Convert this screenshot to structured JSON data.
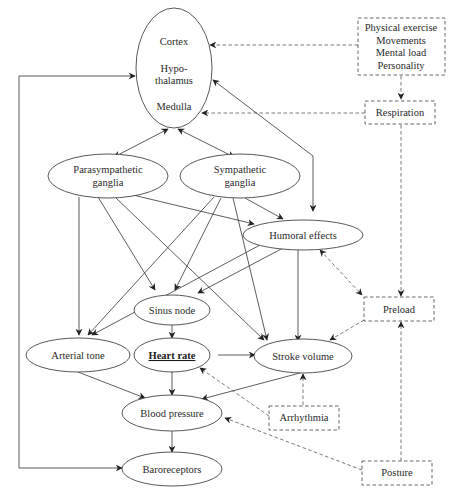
{
  "diagram": {
    "nodes": {
      "brain": {
        "lines": [
          "Cortex",
          "Hypo-",
          "thalamus",
          "Medulla"
        ]
      },
      "parasympathetic": {
        "lines": [
          "Parasympathetic",
          "ganglia"
        ]
      },
      "sympathetic": {
        "lines": [
          "Sympathetic",
          "ganglia"
        ]
      },
      "humoral": {
        "label": "Humoral effects"
      },
      "sinus": {
        "label": "Sinus node"
      },
      "arterial": {
        "label": "Arterial tone"
      },
      "heart_rate": {
        "label": "Heart rate"
      },
      "stroke_volume": {
        "label": "Stroke volume"
      },
      "blood_pressure": {
        "label": "Blood pressure"
      },
      "baroreceptors": {
        "label": "Baroreceptors"
      }
    },
    "external_factors": {
      "lifestyle": {
        "lines": [
          "Physical exercise",
          "Movements",
          "Mental load",
          "Personality"
        ]
      },
      "respiration": {
        "label": "Respiration"
      },
      "preload": {
        "label": "Preload"
      },
      "arrhythmia": {
        "label": "Arrhythmia"
      },
      "posture": {
        "label": "Posture"
      }
    },
    "edges": [
      {
        "from": "lifestyle",
        "to": "brain",
        "style": "dashed"
      },
      {
        "from": "lifestyle",
        "to": "respiration",
        "style": "dashed"
      },
      {
        "from": "respiration",
        "to": "brain",
        "style": "dashed"
      },
      {
        "from": "respiration",
        "to": "preload",
        "style": "dashed"
      },
      {
        "from": "brain",
        "to": "parasympathetic",
        "style": "solid",
        "bidirectional": true
      },
      {
        "from": "brain",
        "to": "sympathetic",
        "style": "solid",
        "bidirectional": true
      },
      {
        "from": "brain",
        "to": "humoral",
        "style": "solid",
        "bidirectional": true
      },
      {
        "from": "parasympathetic",
        "to": "arterial",
        "style": "solid"
      },
      {
        "from": "parasympathetic",
        "to": "sinus",
        "style": "solid"
      },
      {
        "from": "parasympathetic",
        "to": "stroke_volume",
        "style": "solid"
      },
      {
        "from": "parasympathetic",
        "to": "humoral",
        "style": "solid"
      },
      {
        "from": "sympathetic",
        "to": "humoral",
        "style": "solid"
      },
      {
        "from": "sympathetic",
        "to": "sinus",
        "style": "solid"
      },
      {
        "from": "sympathetic",
        "to": "arterial",
        "style": "solid"
      },
      {
        "from": "sympathetic",
        "to": "stroke_volume",
        "style": "solid"
      },
      {
        "from": "humoral",
        "to": "sinus",
        "style": "solid"
      },
      {
        "from": "humoral",
        "to": "arterial",
        "style": "solid"
      },
      {
        "from": "humoral",
        "to": "stroke_volume",
        "style": "solid"
      },
      {
        "from": "humoral",
        "to": "preload",
        "style": "dashed",
        "bidirectional": true
      },
      {
        "from": "sinus",
        "to": "heart_rate",
        "style": "solid"
      },
      {
        "from": "heart_rate",
        "to": "stroke_volume",
        "style": "solid"
      },
      {
        "from": "heart_rate",
        "to": "blood_pressure",
        "style": "solid"
      },
      {
        "from": "arterial",
        "to": "blood_pressure",
        "style": "solid"
      },
      {
        "from": "stroke_volume",
        "to": "blood_pressure",
        "style": "solid"
      },
      {
        "from": "preload",
        "to": "stroke_volume",
        "style": "dashed"
      },
      {
        "from": "arrhythmia",
        "to": "heart_rate",
        "style": "dashed"
      },
      {
        "from": "arrhythmia",
        "to": "stroke_volume",
        "style": "dashed"
      },
      {
        "from": "posture",
        "to": "blood_pressure",
        "style": "dashed"
      },
      {
        "from": "posture",
        "to": "preload",
        "style": "dashed"
      },
      {
        "from": "blood_pressure",
        "to": "baroreceptors",
        "style": "solid"
      },
      {
        "from": "baroreceptors",
        "to": "brain",
        "style": "solid",
        "bidirectional": true
      }
    ]
  }
}
